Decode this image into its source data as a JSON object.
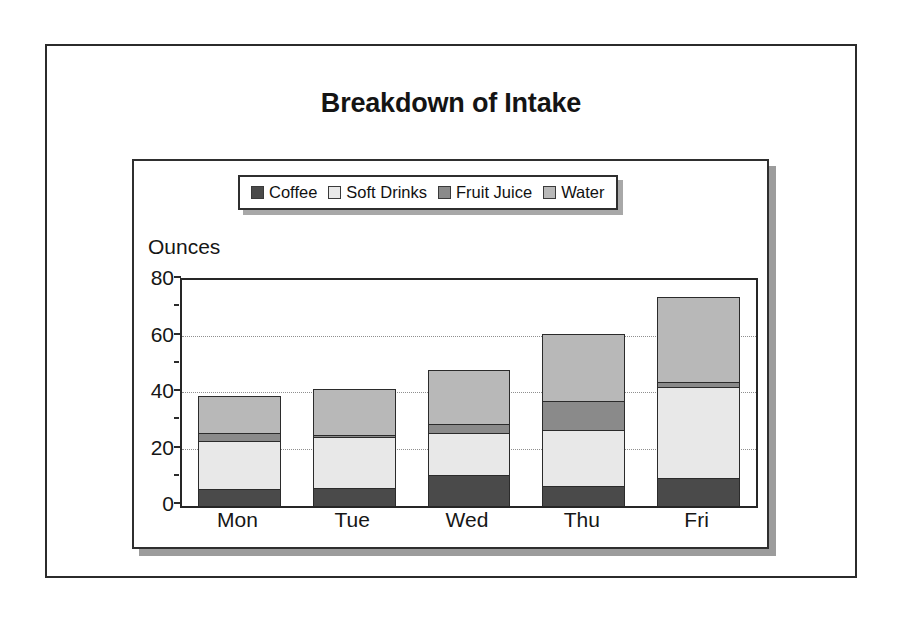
{
  "page": {
    "title": "Breakdown of Intake"
  },
  "axis": {
    "y_title": "Ounces"
  },
  "colors": {
    "coffee": "#4a4a4a",
    "soft_drinks": "#e8e8e8",
    "fruit_juice": "#8a8a8a",
    "water": "#b8b8b8",
    "outline": "#2b2b2b",
    "gridline": "#8f8f8f",
    "shadow": "#9c9c9c",
    "background": "#ffffff"
  },
  "legend": {
    "entries": [
      {
        "label": "Coffee",
        "color": "#4a4a4a"
      },
      {
        "label": "Soft Drinks",
        "color": "#e8e8e8"
      },
      {
        "label": "Fruit Juice",
        "color": "#8a8a8a"
      },
      {
        "label": "Water",
        "color": "#b8b8b8"
      }
    ]
  },
  "chart_data": {
    "type": "bar",
    "stacked": true,
    "title": "Breakdown of Intake",
    "xlabel": "",
    "ylabel": "Ounces",
    "ylim": [
      0,
      80
    ],
    "yticks": [
      0,
      20,
      40,
      60,
      80
    ],
    "yminorticks": [
      10,
      30,
      50,
      70
    ],
    "grid": true,
    "gridlines_at": [
      20,
      40,
      60
    ],
    "legend_position": "top-center",
    "categories": [
      "Mon",
      "Tue",
      "Wed",
      "Thu",
      "Fri"
    ],
    "series": [
      {
        "name": "Coffee",
        "color": "#4a4a4a",
        "values": [
          6,
          6.5,
          11,
          7,
          10
        ]
      },
      {
        "name": "Soft Drinks",
        "color": "#e8e8e8",
        "values": [
          17,
          18,
          15,
          20,
          32
        ]
      },
      {
        "name": "Fruit Juice",
        "color": "#8a8a8a",
        "values": [
          3,
          0.5,
          3,
          10,
          2
        ]
      },
      {
        "name": "Water",
        "color": "#b8b8b8",
        "values": [
          13,
          16.5,
          19,
          24,
          30
        ]
      }
    ],
    "totals": [
      39,
      41.5,
      48,
      61,
      74
    ]
  }
}
